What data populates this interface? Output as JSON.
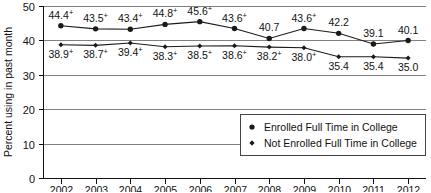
{
  "chart_data": {
    "type": "line",
    "title": "",
    "xlabel": "",
    "ylabel": "Percent using in past month",
    "categories": [
      "2002",
      "2003",
      "2004",
      "2005",
      "2006",
      "2007",
      "2008",
      "2009",
      "2010",
      "2011",
      "2012"
    ],
    "ylim": [
      0,
      50
    ],
    "yticks": [
      "0",
      "10",
      "20",
      "30",
      "40",
      "50"
    ],
    "grid": true,
    "legend_position": "bottom-right",
    "series": [
      {
        "name": "Enrolled Full Time in College",
        "marker": "filled-circle",
        "values": [
          44.4,
          43.5,
          43.4,
          44.8,
          45.6,
          43.6,
          40.7,
          43.6,
          42.2,
          39.1,
          40.1
        ],
        "labels": [
          "44.4",
          "43.5",
          "43.4",
          "44.8",
          "45.6",
          "43.6",
          "40.7",
          "43.6",
          "42.2",
          "39.1",
          "40.1"
        ],
        "significance": [
          "+",
          "+",
          "+",
          "+",
          "+",
          "+",
          "",
          "+",
          "",
          "",
          ""
        ]
      },
      {
        "name": "Not Enrolled Full Time in College",
        "marker": "diamond",
        "values": [
          38.9,
          38.7,
          39.4,
          38.3,
          38.5,
          38.6,
          38.2,
          38.0,
          35.4,
          35.4,
          35.0
        ],
        "labels": [
          "38.9",
          "38.7",
          "39.4",
          "38.3",
          "38.5",
          "38.6",
          "38.2",
          "38.0",
          "35.4",
          "35.4",
          "35.0"
        ],
        "significance": [
          "+",
          "+",
          "+",
          "+",
          "+",
          "+",
          "+",
          "+",
          "",
          "",
          ""
        ]
      }
    ]
  },
  "legend": {
    "items": [
      {
        "label": "Enrolled Full Time in College"
      },
      {
        "label": "Not Enrolled Full Time in College"
      }
    ]
  },
  "colors": {
    "line": "#1a1a1a",
    "grid": "#808080",
    "axis": "#111111",
    "text": "#111111",
    "background": "#ffffff"
  }
}
